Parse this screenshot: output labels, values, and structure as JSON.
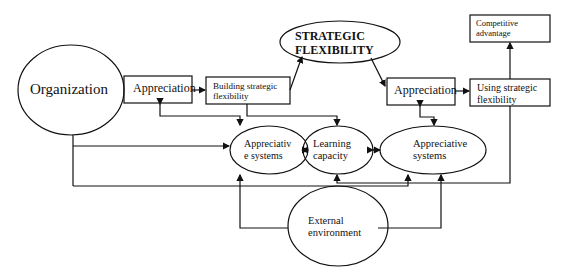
{
  "nodes": {
    "organization": "Organization",
    "appreciation_left": "Appreciation",
    "building_line1": "Building strategic",
    "building_line2": "flexibility",
    "strategic_line1": "STRATEGIC",
    "strategic_line2": "FLEXIBILITY",
    "appreciation_right": "Appreciation",
    "using_line1": "Using strategic",
    "using_line2": "flexibility",
    "competitive_line1": "Competitive",
    "competitive_line2": "advantage",
    "appsys_left_line1": "Appreciativ",
    "appsys_left_line2": "e systems",
    "learning_line1": "Learning",
    "learning_line2": "capacity",
    "appsys_right_line1": "Appreciative",
    "appsys_right_line2": "systems",
    "external_line1": "External",
    "external_line2": "environment"
  },
  "colors": {
    "stroke": "#111111",
    "background": "#ffffff"
  }
}
